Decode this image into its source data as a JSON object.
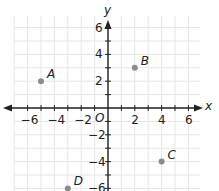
{
  "chart_data": {
    "type": "scatter",
    "title": "",
    "xlabel": "x",
    "ylabel": "y",
    "origin_label": "O",
    "xlim": [
      -7,
      7
    ],
    "ylim": [
      -6,
      7
    ],
    "grid": true,
    "x_ticks": [
      -6,
      -4,
      -2,
      2,
      4,
      6
    ],
    "y_ticks": [
      6,
      4,
      2,
      -2,
      -4,
      -6
    ],
    "x_tick_labels": [
      "−6",
      "−4",
      "−2",
      "2",
      "4",
      "6"
    ],
    "y_tick_labels": [
      "6",
      "4",
      "2",
      "−2",
      "−4",
      "−6"
    ],
    "points": [
      {
        "label": "A",
        "x": -5,
        "y": 2
      },
      {
        "label": "B",
        "x": 2,
        "y": 3
      },
      {
        "label": "C",
        "x": 4,
        "y": -4
      },
      {
        "label": "D",
        "x": -3,
        "y": -6
      }
    ],
    "colors": {
      "grid": "#e6e6e6",
      "axis": "#222222",
      "point": "#8c8c8c"
    }
  }
}
